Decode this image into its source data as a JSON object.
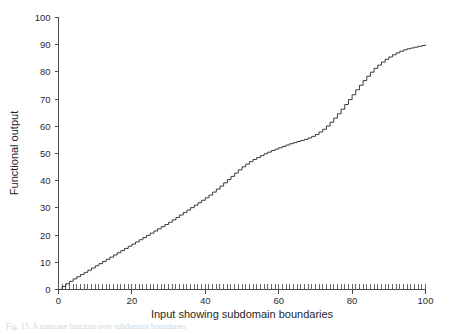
{
  "chart_data": {
    "type": "line",
    "title": "",
    "xlabel": "Input showing subdomain boundaries",
    "ylabel": "Functional output",
    "xlim": [
      0,
      100
    ],
    "ylim": [
      0,
      100
    ],
    "xticks": [
      0,
      20,
      40,
      60,
      80,
      100
    ],
    "yticks": [
      0,
      10,
      20,
      30,
      40,
      50,
      60,
      70,
      80,
      90,
      100
    ],
    "xtick_labels": [
      "0",
      "20",
      "40",
      "60",
      "80",
      "100"
    ],
    "ytick_labels": [
      "0",
      "10",
      "20",
      "30",
      "40",
      "50",
      "60",
      "70",
      "80",
      "90",
      "100"
    ],
    "grid": false,
    "legend": false,
    "legend_position": "none",
    "line_color": "#3a3a3a",
    "step_style": "staircase",
    "subdomain_boundary_count": 100,
    "subdomain_boundary_spacing": 1,
    "series": [
      {
        "name": "functional output",
        "x": [
          0,
          1,
          2,
          3,
          4,
          5,
          6,
          7,
          8,
          9,
          10,
          11,
          12,
          13,
          14,
          15,
          16,
          17,
          18,
          19,
          20,
          21,
          22,
          23,
          24,
          25,
          26,
          27,
          28,
          29,
          30,
          31,
          32,
          33,
          34,
          35,
          36,
          37,
          38,
          39,
          40,
          41,
          42,
          43,
          44,
          45,
          46,
          47,
          48,
          49,
          50,
          51,
          52,
          53,
          54,
          55,
          56,
          57,
          58,
          59,
          60,
          61,
          62,
          63,
          64,
          65,
          66,
          67,
          68,
          69,
          70,
          71,
          72,
          73,
          74,
          75,
          76,
          77,
          78,
          79,
          80,
          81,
          82,
          83,
          84,
          85,
          86,
          87,
          88,
          89,
          90,
          91,
          92,
          93,
          94,
          95,
          96,
          97,
          98,
          99,
          100
        ],
        "y": [
          0.0,
          1.1,
          2.1,
          3.0,
          3.9,
          4.7,
          5.5,
          6.3,
          7.1,
          7.9,
          8.7,
          9.5,
          10.3,
          11.1,
          11.9,
          12.7,
          13.5,
          14.3,
          15.1,
          15.9,
          16.7,
          17.5,
          18.3,
          19.1,
          19.9,
          20.7,
          21.5,
          22.3,
          23.1,
          23.9,
          24.7,
          25.6,
          26.5,
          27.4,
          28.3,
          29.2,
          30.1,
          31.0,
          31.9,
          32.8,
          33.7,
          34.7,
          35.8,
          36.9,
          38.0,
          39.2,
          40.4,
          41.6,
          42.8,
          44.0,
          45.1,
          46.1,
          47.0,
          47.8,
          48.5,
          49.2,
          49.9,
          50.5,
          51.1,
          51.6,
          52.1,
          52.6,
          53.1,
          53.6,
          54.0,
          54.4,
          54.8,
          55.2,
          55.7,
          56.3,
          57.0,
          57.9,
          58.9,
          60.1,
          61.5,
          63.0,
          64.6,
          66.3,
          68.0,
          69.8,
          71.6,
          73.4,
          75.1,
          76.8,
          78.4,
          79.9,
          81.3,
          82.5,
          83.6,
          84.6,
          85.5,
          86.3,
          87.0,
          87.6,
          88.1,
          88.5,
          88.8,
          89.1,
          89.4,
          89.7,
          90.0
        ]
      }
    ]
  },
  "figure": {
    "caption_fragment": "Fig. 15. A staircase function over subdomain boundaries"
  }
}
